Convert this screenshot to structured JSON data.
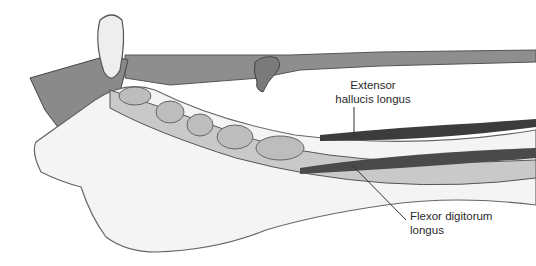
{
  "figure": {
    "labels": [
      {
        "id": "extensor",
        "line1": "Extensor",
        "line2": "hallucis longus"
      },
      {
        "id": "flexor",
        "line1": "Flexor digitorum",
        "line2": "longus"
      }
    ],
    "colors": {
      "strap": "#8a8a8a",
      "strap_dark": "#5e5e5e",
      "skin": "#f2f2f2",
      "tendon": "#b8b8b8",
      "muscle_dark": "#3c3c3c",
      "outline": "#555555",
      "leader": "#333333"
    }
  }
}
